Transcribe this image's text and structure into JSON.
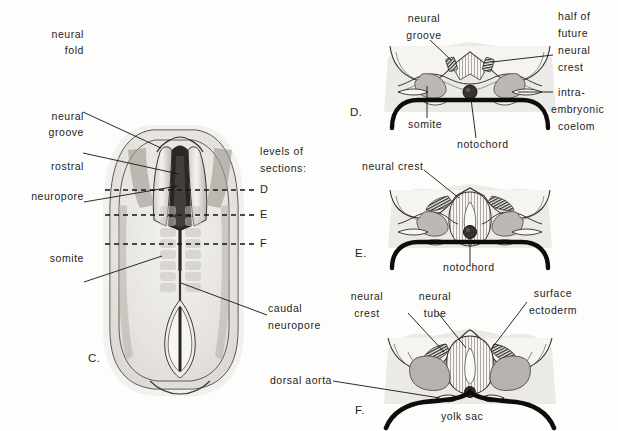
{
  "figure": {
    "background_color": "#fdfdfc",
    "ink_color": "#1d1d1d",
    "tissue_fill": "#e9e7e3",
    "somite_fill": "#b8b5b1",
    "crest_fill": "#3a3a3a"
  },
  "panels": {
    "c": {
      "letter": "C.",
      "labels": {
        "neural_fold_line1": "neural",
        "neural_fold_line2": "fold",
        "neural_groove_line1": "neural",
        "neural_groove_line2": "groove",
        "rostral_line1": "rostral",
        "rostral_line2": "neuropore",
        "somite": "somite",
        "caudal_line1": "caudal",
        "caudal_line2": "neuropore"
      },
      "levels_caption_line1": "levels of",
      "levels_caption_line2": "sections:",
      "section_levels": [
        {
          "letter": "D",
          "y": 190
        },
        {
          "letter": "E",
          "y": 215
        },
        {
          "letter": "F",
          "y": 244
        }
      ]
    },
    "d": {
      "letter": "D.",
      "labels": {
        "neural_groove_line1": "neural",
        "neural_groove_line2": "groove",
        "half_future_crest_line1": "half of",
        "half_future_crest_line2": "future",
        "half_future_crest_line3": "neural",
        "half_future_crest_line4": "crest",
        "coelom_line1": "intra-",
        "coelom_line2": "embryonic",
        "coelom_line3": "coelom",
        "somite": "somite",
        "notochord": "notochord"
      }
    },
    "e": {
      "letter": "E.",
      "labels": {
        "neural_crest": "neural crest",
        "notochord": "notochord"
      }
    },
    "f": {
      "letter": "F.",
      "labels": {
        "neural_crest_line1": "neural",
        "neural_crest_line2": "crest",
        "neural_tube_line1": "neural",
        "neural_tube_line2": "tube",
        "surface_ectoderm_line1": "surface",
        "surface_ectoderm_line2": "ectoderm",
        "dorsal_aorta": "dorsal aorta",
        "yolk_sac": "yolk sac"
      }
    }
  }
}
